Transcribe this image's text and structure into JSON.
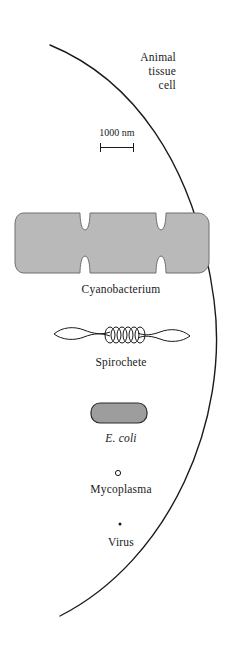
{
  "figure": {
    "background_color": "#ffffff",
    "line_color": "#1a1a1a",
    "organism_fill_color": "#b9b9b9",
    "organism_stroke_color": "#5a5a5a"
  },
  "animal_cell": {
    "label": "Animal\ntissue\ncell",
    "line1": "Animal",
    "line2": "tissue",
    "line3": "cell",
    "shape": "arc-edge"
  },
  "scale": {
    "label": "1000 nm",
    "value": 1000,
    "unit": "nm",
    "bar_length_px": 34
  },
  "organisms": [
    {
      "name": "Cyanobacterium",
      "label": "Cyanobacterium",
      "shape": "notched-rounded-bar",
      "italic": false,
      "fill": "#b9b9b9"
    },
    {
      "name": "Spirochete",
      "label": "Spirochete",
      "shape": "helical-outline",
      "italic": false,
      "fill": "none"
    },
    {
      "name": "E. coli",
      "label": "E. coli",
      "shape": "capsule",
      "italic": true,
      "fill": "#9d9d9d"
    },
    {
      "name": "Mycoplasma",
      "label": "Mycoplasma",
      "shape": "small-open-circle",
      "italic": false,
      "fill": "none"
    },
    {
      "name": "Virus",
      "label": "Virus",
      "shape": "dot",
      "italic": false,
      "fill": "#1a1a1a"
    }
  ]
}
